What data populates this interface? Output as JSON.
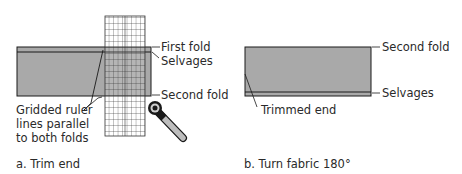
{
  "panel_a": {
    "caption": "a. Trim end",
    "labels": {
      "first_fold": "First fold",
      "selvages": "Selvages",
      "second_fold": "Second fold",
      "ruler_line1": "Gridded ruler",
      "ruler_line2": "lines parallel",
      "ruler_line3": "to both folds"
    }
  },
  "panel_b": {
    "caption": "b. Turn fabric 180°",
    "labels": {
      "second_fold": "Second fold",
      "selvages": "Selvages",
      "trimmed_end": "Trimmed end"
    }
  },
  "colors": {
    "fabric": "#a9a9a9",
    "outline": "#1a1a1a",
    "ruler_fill": "#ffffff"
  }
}
